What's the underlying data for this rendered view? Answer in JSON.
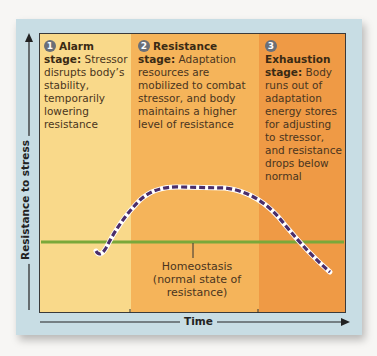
{
  "diagram": {
    "stages": [
      {
        "number": "1",
        "title": "Alarm stage:",
        "description": "Stressor disrupts body’s stability, temporarily lowering resistance",
        "color": "#f9d98a"
      },
      {
        "number": "2",
        "title": "Resistance stage:",
        "description": "Adaptation resources are mobilized to combat stressor, and body maintains a higher level of resistance",
        "color": "#f5b45a"
      },
      {
        "number": "3",
        "title": "Exhaustion stage:",
        "description": "Body runs out of adaptation energy stores for adjusting to stressor, and resistance drops below normal",
        "color": "#ef9a45"
      }
    ],
    "homeostasis_label": "Homeostasis (normal state of resistance)",
    "y_axis_label": "Resistance to stress",
    "x_axis_label": "Time",
    "colors": {
      "panel": "#c8dde4",
      "homeostasis_line": "#7aa83a",
      "curve": "#4b2e6b"
    }
  }
}
